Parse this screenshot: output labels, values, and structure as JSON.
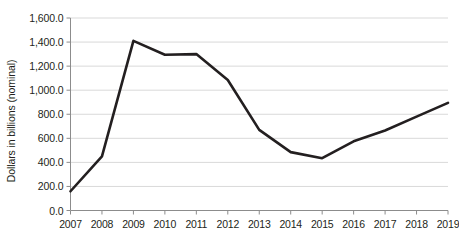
{
  "chart_data": {
    "type": "line",
    "title": "",
    "xlabel": "",
    "ylabel": "Dollars in billions (nominal)",
    "categories": [
      "2007",
      "2008",
      "2009",
      "2010",
      "2011",
      "2012",
      "2013",
      "2014",
      "2015",
      "2016",
      "2017",
      "2018",
      "2019"
    ],
    "x": [
      2007,
      2008,
      2009,
      2010,
      2011,
      2012,
      2013,
      2014,
      2015,
      2016,
      2017,
      2018,
      2019
    ],
    "values": [
      160.0,
      450.0,
      1410.0,
      1295.0,
      1300.0,
      1085.0,
      670.0,
      485.0,
      435.0,
      575.0,
      665.0,
      780.0,
      895.0
    ],
    "series": [
      {
        "name": "Dollars in billions (nominal)",
        "values": [
          160.0,
          450.0,
          1410.0,
          1295.0,
          1300.0,
          1085.0,
          670.0,
          485.0,
          435.0,
          575.0,
          665.0,
          780.0,
          895.0
        ]
      }
    ],
    "ylim": [
      0,
      1600
    ],
    "ytick_values": [
      0,
      200,
      400,
      600,
      800,
      1000,
      1200,
      1400,
      1600
    ],
    "ytick_labels": [
      "0.0",
      "200.0",
      "400.0",
      "600.0",
      "800.0",
      "1,000.0",
      "1,200.0",
      "1,400.0",
      "1,600.0"
    ],
    "grid": true,
    "grid_axis": "y",
    "legend": false,
    "legend_position": "none",
    "line_color": "#231f20",
    "grid_color": "#d9d9d9",
    "axis_color": "#808080",
    "text_color": "#231f20",
    "background_color": "#ffffff",
    "markers": false,
    "line_width": 2.6
  }
}
